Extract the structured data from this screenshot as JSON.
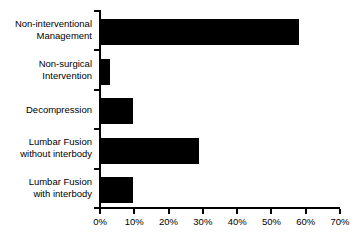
{
  "chart_data": {
    "type": "bar",
    "orientation": "horizontal",
    "title": "",
    "subtitle": "",
    "xlabel": "",
    "ylabel": "",
    "xlim": [
      0,
      70
    ],
    "grid": false,
    "legend": false,
    "bar_color": "#000000",
    "axis_color": "#000000",
    "background_color": "#ffffff",
    "categories": [
      "Non-interventional Management",
      "Non-surgical Intervention",
      "Decompression",
      "Lumbar Fusion without interbody",
      "Lumbar Fusion with interbody"
    ],
    "category_lines": [
      [
        "Non-interventional",
        "Management"
      ],
      [
        "Non-surgical",
        "Intervention"
      ],
      [
        "Decompression"
      ],
      [
        "Lumbar Fusion",
        "without interbody"
      ],
      [
        "Lumbar Fusion",
        "with interbody"
      ]
    ],
    "values": [
      58,
      3,
      9.5,
      29,
      9.5
    ],
    "value_labels": [
      "58%",
      "3%",
      "9.5%",
      "29%",
      "9.5%"
    ],
    "xticks": [
      0,
      10,
      20,
      30,
      40,
      50,
      60,
      70
    ],
    "xtick_labels": [
      "0%",
      "10%",
      "20%",
      "30%",
      "40%",
      "50%",
      "60%",
      "70%"
    ]
  }
}
